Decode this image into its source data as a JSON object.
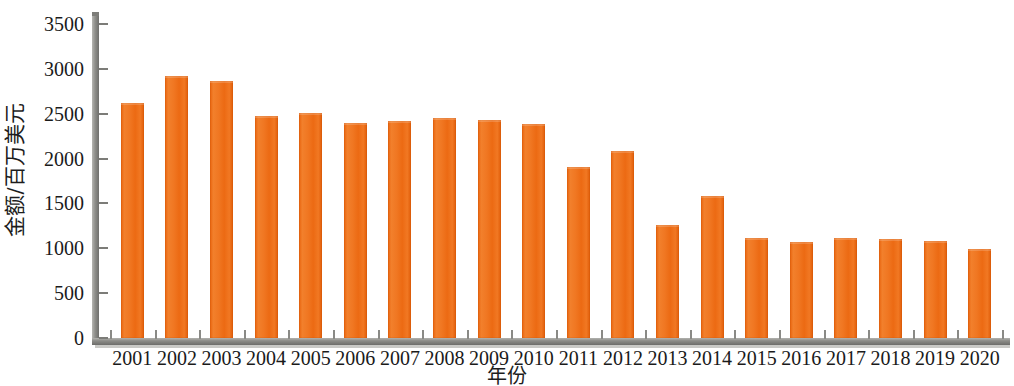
{
  "chart_data": {
    "type": "bar",
    "title": "",
    "xlabel": "年份",
    "ylabel": "金额/百万美元",
    "categories": [
      "2001",
      "2002",
      "2003",
      "2004",
      "2005",
      "2006",
      "2007",
      "2008",
      "2009",
      "2010",
      "2011",
      "2012",
      "2013",
      "2014",
      "2015",
      "2016",
      "2017",
      "2018",
      "2019",
      "2020"
    ],
    "values": [
      2620,
      2920,
      2860,
      2480,
      2510,
      2400,
      2420,
      2450,
      2430,
      2380,
      1910,
      2090,
      1260,
      1580,
      1110,
      1070,
      1110,
      1100,
      1080,
      990
    ],
    "series": [
      {
        "name": "金额",
        "values": [
          2620,
          2920,
          2860,
          2480,
          2510,
          2400,
          2420,
          2450,
          2430,
          2380,
          1910,
          2090,
          1260,
          1580,
          1110,
          1070,
          1110,
          1100,
          1080,
          990
        ]
      }
    ],
    "ylim": [
      0,
      3500
    ],
    "y_ticks": [
      0,
      500,
      1000,
      1500,
      2000,
      2500,
      3000,
      3500
    ],
    "y_tick_labels": [
      "0",
      "500",
      "1000",
      "1500",
      "2000",
      "2500",
      "3000",
      "3500"
    ],
    "grid": false,
    "legend": "none",
    "bar_color": "#ef6f1c",
    "axis_color": "#8a8a86",
    "text_color": "#1a1a1a"
  }
}
